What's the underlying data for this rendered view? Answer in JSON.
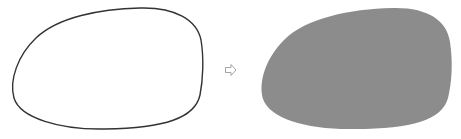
{
  "diagram": {
    "left_shape": {
      "label": "outline-shape",
      "stroke": "#333333",
      "fill": "none",
      "stroke_width": 1.4
    },
    "arrow": {
      "icon": "right-arrow-outline-icon",
      "stroke": "#9a9a9a",
      "fill": "#ffffff"
    },
    "right_shape": {
      "label": "filled-shape",
      "fill": "#8c8c8c",
      "stroke": "none"
    }
  }
}
